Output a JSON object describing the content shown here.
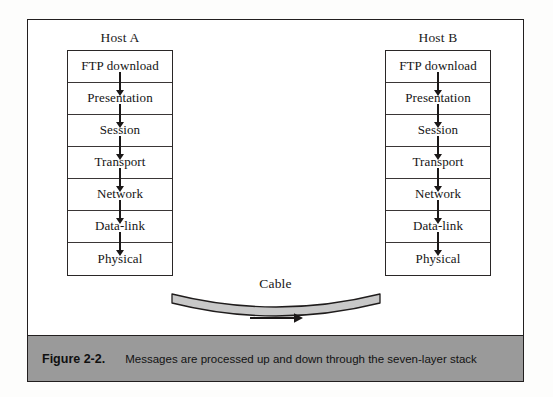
{
  "figure": {
    "caption_number": "Figure 2-2.",
    "caption_text": "Messages are processed up and down through the seven-layer stack",
    "caption_bar_color": "#9a9a9a",
    "frame_border_color": "#221f1f",
    "background_color": "#ffffff"
  },
  "diagram": {
    "hosts": [
      {
        "id": "host-a",
        "label": "Host A",
        "layers": [
          {
            "label": "FTP download"
          },
          {
            "label": "Presentation"
          },
          {
            "label": "Session"
          },
          {
            "label": "Transport"
          },
          {
            "label": "Network"
          },
          {
            "label": "Data-link"
          },
          {
            "label": "Physical"
          }
        ]
      },
      {
        "id": "host-b",
        "label": "Host B",
        "layers": [
          {
            "label": "FTP download"
          },
          {
            "label": "Presentation"
          },
          {
            "label": "Session"
          },
          {
            "label": "Transport"
          },
          {
            "label": "Network"
          },
          {
            "label": "Data-link"
          },
          {
            "label": "Physical"
          }
        ]
      }
    ],
    "cable": {
      "label": "Cable",
      "fill_color": "#c8c8c8",
      "stroke_color": "#1f1c1c",
      "direction_arrow": "right"
    },
    "flow_arrow_direction": "down",
    "flow_arrow_color": "#1b1818"
  }
}
